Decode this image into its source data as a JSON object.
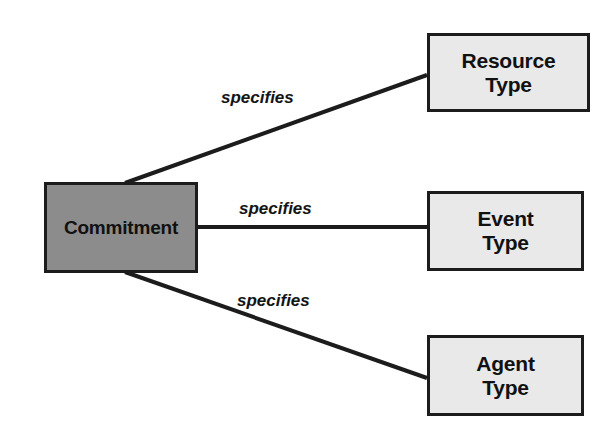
{
  "diagram": {
    "background_color": "#ffffff",
    "line_color": "#1c1c1c",
    "nodes": [
      {
        "id": "commitment",
        "label": "Commitment",
        "fill": "#8c8c8c",
        "border": "#1c1c1c",
        "text_color": "#111111"
      },
      {
        "id": "resource-type",
        "label": "Resource\nType",
        "fill": "#e9e9e9",
        "border": "#1c1c1c",
        "text_color": "#111111"
      },
      {
        "id": "event-type",
        "label": "Event\nType",
        "fill": "#e9e9e9",
        "border": "#1c1c1c",
        "text_color": "#111111"
      },
      {
        "id": "agent-type",
        "label": "Agent\nType",
        "fill": "#e9e9e9",
        "border": "#1c1c1c",
        "text_color": "#111111"
      }
    ],
    "edges": [
      {
        "id": "edge-resource",
        "from": "commitment",
        "to": "resource-type",
        "label": "specifies"
      },
      {
        "id": "edge-event",
        "from": "commitment",
        "to": "event-type",
        "label": "specifies"
      },
      {
        "id": "edge-agent",
        "from": "commitment",
        "to": "agent-type",
        "label": "specifies"
      }
    ]
  }
}
